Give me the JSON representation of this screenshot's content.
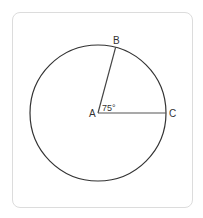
{
  "diagram": {
    "points": {
      "A": {
        "label": "A"
      },
      "B": {
        "label": "B"
      },
      "C": {
        "label": "C"
      }
    },
    "angle": {
      "label": "75°",
      "value": 75,
      "vertex": "A",
      "between": [
        "B",
        "C"
      ]
    },
    "shape": "circle",
    "stroke_color": "#333333",
    "radius_color": "#555555"
  }
}
